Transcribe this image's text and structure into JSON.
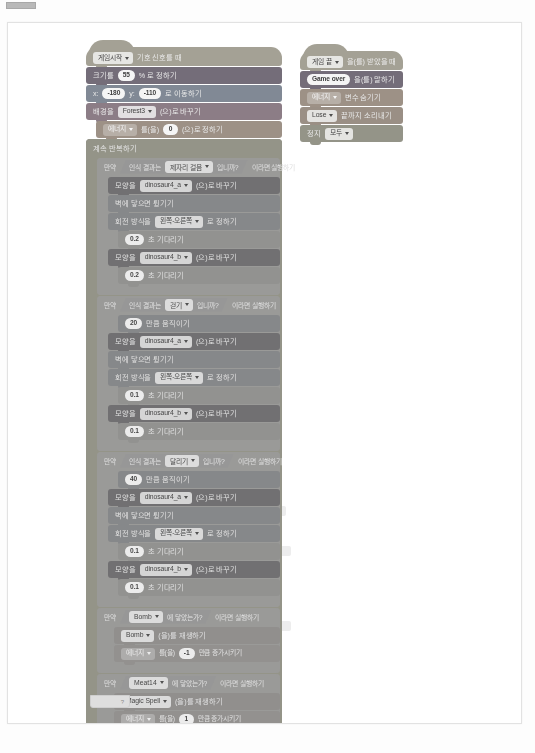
{
  "window": {
    "title": "Entry block workspace scan"
  },
  "scripts": {
    "main": {
      "hat": {
        "event_target": "게임시작",
        "label": "기호 신호를 때"
      },
      "setup": [
        {
          "pre": "크기를",
          "value": "55",
          "post": "% 로 정하기"
        },
        {
          "pre": "x:",
          "value": "-180",
          "mid": "y:",
          "value2": "-110",
          "post": "로 이동하기"
        },
        {
          "pre": "배경을",
          "dropdown": "Forest3",
          "post": "(으)로 바꾸기"
        },
        {
          "dropdown": "에너지",
          "pre2": "를(을)",
          "value": "0",
          "post": "(으)로 정하기"
        }
      ],
      "forever_label": "계속 반복하기",
      "branches": [
        {
          "condition_pre": "만약",
          "condition": "인식 결과는 · 제자리 걸음",
          "condition_dd": "제자리 걸음",
          "condition_post": "입니까?",
          "then_label": "이라면 실행하기",
          "blocks": [
            {
              "type": "look",
              "pre": "모양을",
              "dropdown": "dinosaur4_a",
              "post": "(으)로 바꾸기"
            },
            {
              "type": "motion",
              "text": "벽에 닿으면 튕기기"
            },
            {
              "type": "motion",
              "pre": "회전 방식을",
              "dropdown": "왼쪽-오른쪽",
              "post": "로 정하기"
            },
            {
              "type": "ctrl",
              "value": "0.2",
              "post": "초 기다리기"
            },
            {
              "type": "look",
              "pre": "모양을",
              "dropdown": "dinosaur4_b",
              "post": "(으)로 바꾸기"
            },
            {
              "type": "ctrl",
              "value": "0.2",
              "post": "초 기다리기"
            }
          ]
        },
        {
          "condition_pre": "만약",
          "condition_dd": "걷기",
          "condition_post": "입니까?",
          "then_label": "이라면 실행하기",
          "blocks": [
            {
              "type": "motion",
              "value": "20",
              "post": "만큼 움직이기"
            },
            {
              "type": "look",
              "pre": "모양을",
              "dropdown": "dinosaur4_a",
              "post": "(으)로 바꾸기"
            },
            {
              "type": "motion",
              "text": "벽에 닿으면 튕기기"
            },
            {
              "type": "motion",
              "pre": "회전 방식을",
              "dropdown": "왼쪽-오른쪽",
              "post": "로 정하기"
            },
            {
              "type": "ctrl",
              "value": "0.1",
              "post": "초 기다리기"
            },
            {
              "type": "look",
              "pre": "모양을",
              "dropdown": "dinosaur4_b",
              "post": "(으)로 바꾸기"
            },
            {
              "type": "ctrl",
              "value": "0.1",
              "post": "초 기다리기"
            }
          ]
        },
        {
          "condition_pre": "만약",
          "condition_dd": "달리기",
          "condition_post": "입니까?",
          "then_label": "이라면 실행하기",
          "blocks": [
            {
              "type": "motion",
              "value": "40",
              "post": "만큼 움직이기"
            },
            {
              "type": "look",
              "pre": "모양을",
              "dropdown": "dinosaur4_a",
              "post": "(으)로 바꾸기"
            },
            {
              "type": "motion",
              "text": "벽에 닿으면 튕기기"
            },
            {
              "type": "motion",
              "pre": "회전 방식을",
              "dropdown": "왼쪽-오른쪽",
              "post": "로 정하기"
            },
            {
              "type": "ctrl",
              "value": "0.1",
              "post": "초 기다리기"
            },
            {
              "type": "look",
              "pre": "모양을",
              "dropdown": "dinosaur4_b",
              "post": "(으)로 바꾸기"
            },
            {
              "type": "ctrl",
              "value": "0.1",
              "post": "초 기다리기"
            }
          ]
        },
        {
          "condition_pre": "만약",
          "condition_dd": "Bomb",
          "condition_post": "에 닿았는가?",
          "then_label": "이라면 실행하기",
          "blocks": [
            {
              "type": "sound",
              "dropdown": "Bomb",
              "post": "(을)를 재생하기"
            },
            {
              "type": "var",
              "dropdown": "에너지",
              "pre2": "를(을)",
              "value": "-1",
              "post": "만큼 증가시키기"
            }
          ]
        },
        {
          "condition_pre": "만약",
          "condition_dd": "Meat14",
          "condition_post": "에 닿았는가?",
          "then_label": "이라면 실행하기",
          "blocks": [
            {
              "type": "sound",
              "dropdown": "Magic Spell",
              "post": "(을)를 재생하기"
            },
            {
              "type": "var",
              "dropdown": "에너지",
              "pre2": "를(을)",
              "value": "1",
              "post": "만큼 증가시키기"
            },
            {
              "type": "var",
              "dropdown": "에너지 점수",
              "post": "변수 보이기"
            }
          ]
        },
        {
          "condition_pre": "만약",
          "condition_left": "에너지",
          "operator": "<",
          "condition_right": "0",
          "then_label": "이라면 실행하기",
          "blocks": [
            {
              "type": "scene",
              "pre": "배경을",
              "dropdown": "Forest4",
              "post": "(으)로 바꾸기"
            },
            {
              "type": "event",
              "dropdown": "게임 끝",
              "post": "을(를) 보내고 기다리기"
            }
          ]
        }
      ]
    },
    "secondary": {
      "hat": {
        "event_target": "게임 끝",
        "label": "을(를) 받았을 때"
      },
      "blocks": [
        {
          "type": "look",
          "value": "Game over",
          "post": "을(를) 말하기"
        },
        {
          "type": "var",
          "dropdown": "에너지",
          "post": "변수 숨기기"
        },
        {
          "type": "sound",
          "dropdown": "Lose",
          "post": "끝까지 소리내기"
        },
        {
          "type": "ctrl",
          "pre": "정지",
          "dropdown": "모두"
        }
      ]
    }
  }
}
